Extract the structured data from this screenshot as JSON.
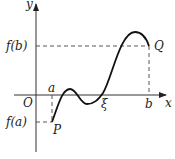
{
  "diagram": {
    "axes": {
      "x_label": "x",
      "y_label": "y",
      "origin_label": "O"
    },
    "labels": {
      "f_b": "f(b)",
      "f_a": "f(a)",
      "a": "a",
      "b": "b",
      "xi": "ξ",
      "P": "P",
      "Q": "Q"
    },
    "colors": {
      "stroke": "#222222",
      "dashed": "#444444"
    }
  }
}
